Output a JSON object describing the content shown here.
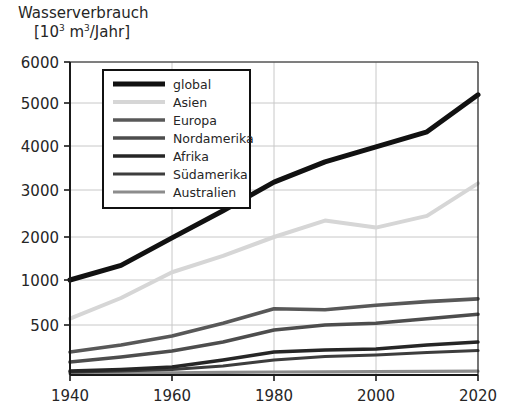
{
  "chart_data": {
    "type": "line",
    "title": "Wasserverbrauch",
    "subtitle": "[10³ m³/Jahr]",
    "title_main": "Wasserverbrauch",
    "unit_prefix": "[10",
    "unit_exp1": "3",
    "unit_mid": " m",
    "unit_exp2": "3",
    "unit_suffix": "/Jahr]",
    "xlabel": "",
    "ylabel": "Wasserverbrauch [10^3 m^3/Jahr]",
    "grid": true,
    "legend_position": "top-left inside",
    "x": [
      1940,
      1950,
      1960,
      1970,
      1980,
      1990,
      2000,
      2010,
      2020
    ],
    "xlim": [
      1940,
      2020
    ],
    "xticks": [
      1940,
      1960,
      1980,
      2000,
      2020
    ],
    "xticklabels": [
      "1940",
      "1960",
      "1980",
      "2000",
      "2020"
    ],
    "ylim": [
      0,
      6000
    ],
    "yticks": [
      500,
      1000,
      2000,
      3000,
      4000,
      5000,
      6000
    ],
    "yticklabels": [
      "500",
      "1000",
      "2000",
      "3000",
      "4000",
      "5000",
      "6000"
    ],
    "y_scale_note": "piecewise: compressed below 1000, linear above",
    "series": [
      {
        "name": "global",
        "color": "#111111",
        "width": 5.0,
        "values": [
          1000,
          1340,
          1980,
          2560,
          3180,
          3640,
          3980,
          4330,
          5200
        ]
      },
      {
        "name": "Asien",
        "color": "#d6d6d6",
        "width": 4.0,
        "values": [
          570,
          800,
          1180,
          1560,
          2000,
          2350,
          2200,
          2450,
          3150
        ]
      },
      {
        "name": "Europa",
        "color": "#585858",
        "width": 3.6,
        "values": [
          230,
          300,
          390,
          520,
          680,
          670,
          720,
          760,
          790
        ]
      },
      {
        "name": "Nordamerika",
        "color": "#4d4d4d",
        "width": 3.6,
        "values": [
          130,
          180,
          240,
          330,
          450,
          500,
          520,
          570,
          620
        ]
      },
      {
        "name": "Afrika",
        "color": "#262626",
        "width": 3.4,
        "values": [
          40,
          55,
          80,
          150,
          230,
          250,
          260,
          300,
          330
        ]
      },
      {
        "name": "Südamerika",
        "color": "#3d3d3d",
        "width": 3.2,
        "values": [
          30,
          40,
          55,
          90,
          150,
          185,
          200,
          225,
          245
        ]
      },
      {
        "name": "Australien",
        "color": "#8c8c8c",
        "width": 3.2,
        "values": [
          15,
          18,
          22,
          26,
          30,
          32,
          34,
          36,
          38
        ]
      }
    ]
  },
  "legend": {
    "entries": [
      {
        "label": "global",
        "color": "#111111",
        "width": 5.0
      },
      {
        "label": "Asien",
        "color": "#d6d6d6",
        "width": 4.0
      },
      {
        "label": "Europa",
        "color": "#585858",
        "width": 3.6
      },
      {
        "label": "Nordamerika",
        "color": "#4d4d4d",
        "width": 3.6
      },
      {
        "label": "Afrika",
        "color": "#262626",
        "width": 3.4
      },
      {
        "label": "Südamerika",
        "color": "#3d3d3d",
        "width": 3.2
      },
      {
        "label": "Australien",
        "color": "#8c8c8c",
        "width": 3.2
      }
    ]
  },
  "style": {
    "axis_color": "#1a1a1a",
    "grid_color": "#c8c8c8",
    "background": "#ffffff",
    "text_color": "#262626"
  }
}
